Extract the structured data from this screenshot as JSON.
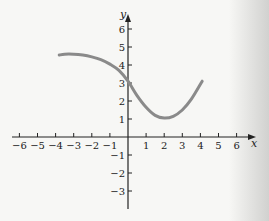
{
  "chart_data": {
    "type": "line",
    "title": "",
    "xlabel": "x",
    "ylabel": "y",
    "xlim": [
      -6.5,
      7
    ],
    "ylim": [
      -4,
      7
    ],
    "grid": false,
    "x_ticks": [
      -6,
      -5,
      -4,
      -3,
      -2,
      -1,
      1,
      2,
      3,
      4,
      5,
      6
    ],
    "y_ticks": [
      -3,
      -2,
      -1,
      1,
      2,
      3,
      4,
      5,
      6
    ],
    "x_tick_labels": [
      "−6",
      "−5",
      "−4",
      "−3",
      "−2",
      "−1",
      "1",
      "2",
      "3",
      "4",
      "5",
      "6"
    ],
    "y_tick_labels": [
      "−3",
      "−2",
      "−1",
      "1",
      "2",
      "3",
      "4",
      "5",
      "6"
    ],
    "series": [
      {
        "name": "f(x)",
        "color": "#8a8a8a",
        "x": [
          -3.8,
          -3.5,
          -3.0,
          -2.5,
          -2.0,
          -1.5,
          -1.0,
          -0.5,
          0.0,
          0.5,
          1.0,
          1.5,
          2.0,
          2.5,
          3.0,
          3.5,
          4.1
        ],
        "y": [
          4.55,
          4.6,
          4.6,
          4.55,
          4.45,
          4.3,
          4.05,
          3.7,
          3.1,
          2.3,
          1.65,
          1.2,
          1.05,
          1.15,
          1.5,
          2.1,
          3.1
        ]
      }
    ]
  }
}
